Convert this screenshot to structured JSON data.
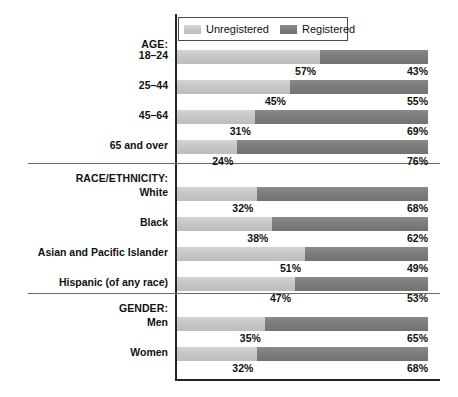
{
  "chart_data": {
    "type": "bar",
    "subtype": "stacked-horizontal-100pct",
    "title": "",
    "xlabel": "",
    "ylabel": "",
    "xlim": [
      0,
      100
    ],
    "grid": false,
    "legend_position": "top-left-inside",
    "legend": [
      {
        "name": "Unregistered",
        "color": "#c6c6c6"
      },
      {
        "name": "Registered",
        "color": "#7c7c7c"
      }
    ],
    "series": [
      {
        "name": "Unregistered",
        "values": [
          57,
          45,
          31,
          24,
          32,
          38,
          51,
          47,
          35,
          32
        ]
      },
      {
        "name": "Registered",
        "values": [
          43,
          55,
          69,
          76,
          68,
          62,
          49,
          53,
          65,
          68
        ]
      }
    ],
    "categories": [
      "18–24",
      "25–44",
      "45–64",
      "65 and over",
      "White",
      "Black",
      "Asian and Pacific Islander",
      "Hispanic (of any race)",
      "Men",
      "Women"
    ],
    "groups": [
      {
        "heading": "AGE:",
        "rows": [
          {
            "label": "18–24",
            "unregistered": 57,
            "registered": 43,
            "unregistered_text": "57%",
            "registered_text": "43%"
          },
          {
            "label": "25–44",
            "unregistered": 45,
            "registered": 55,
            "unregistered_text": "45%",
            "registered_text": "55%"
          },
          {
            "label": "45–64",
            "unregistered": 31,
            "registered": 69,
            "unregistered_text": "31%",
            "registered_text": "69%"
          },
          {
            "label": "65 and over",
            "unregistered": 24,
            "registered": 76,
            "unregistered_text": "24%",
            "registered_text": "76%"
          }
        ]
      },
      {
        "heading": "RACE/ETHNICITY:",
        "rows": [
          {
            "label": "White",
            "unregistered": 32,
            "registered": 68,
            "unregistered_text": "32%",
            "registered_text": "68%"
          },
          {
            "label": "Black",
            "unregistered": 38,
            "registered": 62,
            "unregistered_text": "38%",
            "registered_text": "62%"
          },
          {
            "label": "Asian and Pacific Islander",
            "unregistered": 51,
            "registered": 49,
            "unregistered_text": "51%",
            "registered_text": "49%"
          },
          {
            "label": "Hispanic (of any race)",
            "unregistered": 47,
            "registered": 53,
            "unregistered_text": "47%",
            "registered_text": "53%"
          }
        ]
      },
      {
        "heading": "GENDER:",
        "rows": [
          {
            "label": "Men",
            "unregistered": 35,
            "registered": 65,
            "unregistered_text": "35%",
            "registered_text": "65%"
          },
          {
            "label": "Women",
            "unregistered": 32,
            "registered": 68,
            "unregistered_text": "32%",
            "registered_text": "68%"
          }
        ]
      }
    ]
  },
  "colors": {
    "unregistered": "#c6c6c6",
    "registered": "#7c7c7c",
    "axis": "#262626",
    "separator": "#6a6a6a",
    "text": "#111111"
  }
}
